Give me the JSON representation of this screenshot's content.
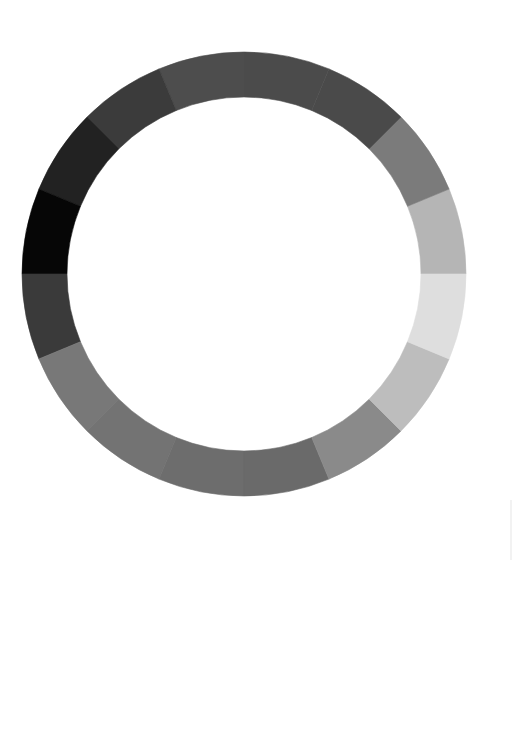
{
  "chart_data": {
    "type": "pie",
    "subtype": "donut-grayscale-ring",
    "title": "",
    "center": [
      244,
      274
    ],
    "outer_radius": 222,
    "inner_radius": 177,
    "start_angle_deg": 0,
    "direction": "counter-clockwise",
    "segment_count": 16,
    "values": [
      1,
      1,
      1,
      1,
      1,
      1,
      1,
      1,
      1,
      1,
      1,
      1,
      1,
      1,
      1,
      1
    ],
    "colors": [
      "#b5b5b5",
      "#7b7b7b",
      "#4a4a4a",
      "#4b4b4b",
      "#4d4d4d",
      "#3b3b3b",
      "#222222",
      "#060606",
      "#3a3a3a",
      "#787878",
      "#737373",
      "#6d6d6d",
      "#6a6a6a",
      "#8a8a8a",
      "#bdbdbd",
      "#dedede"
    ],
    "legend": [],
    "grid": false
  }
}
